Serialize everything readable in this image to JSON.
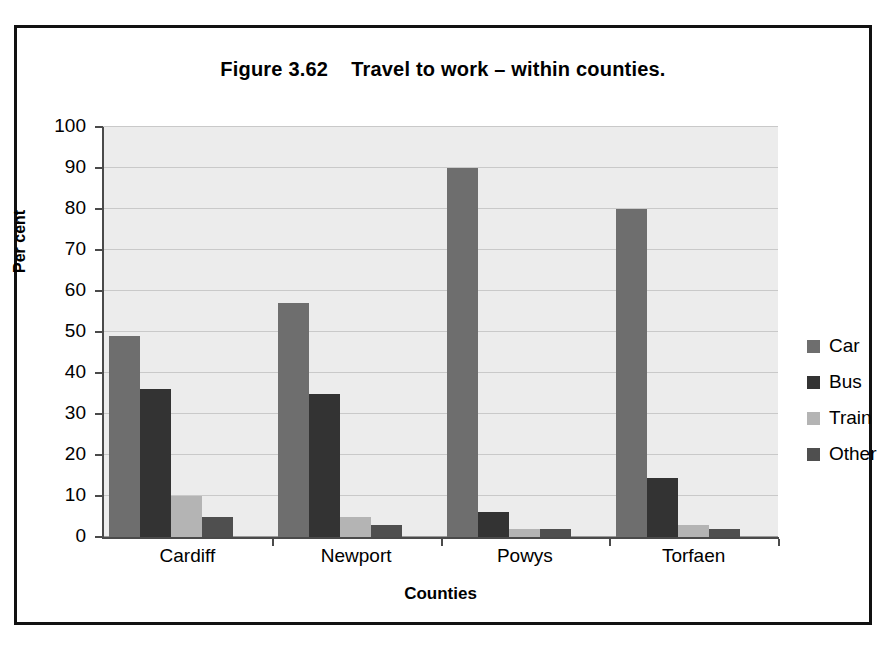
{
  "chart_data": {
    "type": "bar",
    "title": "Figure 3.62    Travel to work – within counties.",
    "xlabel": "Counties",
    "ylabel": "Per cent",
    "categories": [
      "Cardiff",
      "Newport",
      "Powys",
      "Torfaen"
    ],
    "series": [
      {
        "name": "Car",
        "color": "#6e6e6e",
        "values": [
          49,
          57,
          90,
          80
        ]
      },
      {
        "name": "Bus",
        "color": "#333333",
        "values": [
          36,
          35,
          6,
          14.5
        ]
      },
      {
        "name": "Train",
        "color": "#b4b4b4",
        "values": [
          10,
          5,
          2,
          3
        ]
      },
      {
        "name": "Other",
        "color": "#4f4f4f",
        "values": [
          5,
          3,
          2,
          2
        ]
      }
    ],
    "ylim": [
      0,
      100
    ],
    "yticks": [
      0,
      10,
      20,
      30,
      40,
      50,
      60,
      70,
      80,
      90,
      100
    ],
    "ytick_labels": [
      "0",
      "10",
      "20",
      "30",
      "40",
      "50",
      "60",
      "70",
      "80",
      "90",
      "100"
    ],
    "grid": true,
    "legend_position": "right",
    "plot_background": "#ececec",
    "frame_color": "#111111"
  }
}
